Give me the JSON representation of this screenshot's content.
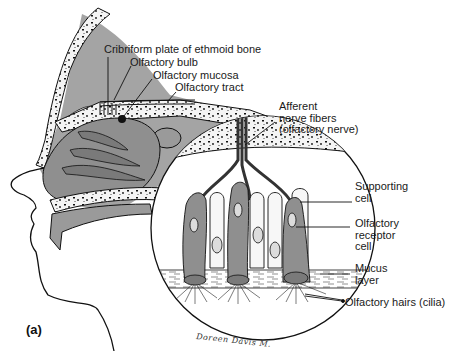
{
  "figure": {
    "panel_label": "(a)",
    "signature": "Doreen Davis M.",
    "colors": {
      "tissue_gray": "#8f8f8f",
      "line": "#1a1a1a",
      "bone_fill": "#f2f2f2",
      "background": "#ffffff"
    },
    "labels": {
      "cribriform": "Cribriform plate of ethmoid bone",
      "bulb": "Olfactory bulb",
      "mucosa": "Olfactory mucosa",
      "tract": "Olfactory tract",
      "afferent": "Afferent\nnerve fibers\n(olfactory nerve)",
      "supporting": "Supporting\ncell",
      "receptor": "Olfactory\nreceptor\ncell",
      "mucus": "Mucus\nlayer",
      "hairs": "Olfactory hairs (cilia)"
    }
  }
}
